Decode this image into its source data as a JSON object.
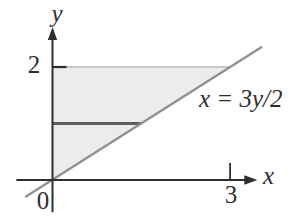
{
  "figure": {
    "background": "#ffffff",
    "ink_color": "#2e2e2e",
    "line_color": "#8f8f8f",
    "strip_color": "#5f5f5f",
    "region_fill": "#ececec",
    "boundary_color": "#b8b8b8"
  },
  "labels": {
    "y_axis": "y",
    "x_axis": "x",
    "origin": "0",
    "y_tick_2": "2",
    "x_tick_3": "3",
    "equation": "x = 3y/2"
  },
  "chart_data": {
    "type": "line",
    "title": "",
    "xlabel": "x",
    "ylabel": "y",
    "x_ticks": [
      {
        "value": 3,
        "label": "3"
      }
    ],
    "y_ticks": [
      {
        "value": 2,
        "label": "2"
      }
    ],
    "origin_label": "0",
    "series": [
      {
        "name": "x = 3y/2",
        "equation_label": "x = 3y/2",
        "points": [
          [
            0,
            0
          ],
          [
            3,
            2
          ]
        ],
        "draw_extent": [
          [
            -0.46,
            -0.3
          ],
          [
            3.54,
            2.36
          ]
        ]
      }
    ],
    "shaded_region": {
      "vertices": [
        [
          0,
          0
        ],
        [
          0,
          2
        ],
        [
          3,
          2
        ]
      ],
      "description": "triangle bounded by the y-axis, the line y = 2, and the line x = 3y/2"
    },
    "strip_segment": {
      "y": 1,
      "x_from": 0,
      "x_to": 1.5
    },
    "axes": {
      "x_range_drawn": [
        -0.61,
        3.46
      ],
      "y_range_drawn": [
        -0.57,
        2.71
      ]
    }
  }
}
